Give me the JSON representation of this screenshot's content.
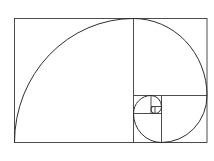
{
  "diagram": {
    "title": "",
    "type": "golden-spiral",
    "colors": {
      "background": "#ffffff",
      "stroke": "#3a3a3a"
    }
  }
}
